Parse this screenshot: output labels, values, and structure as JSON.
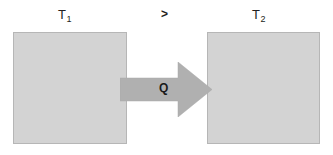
{
  "diagram": {
    "background_color": "#ffffff"
  },
  "labels": {
    "left_temperature": {
      "symbol": "T",
      "subscript": "1"
    },
    "right_temperature": {
      "symbol": "T",
      "subscript": "2"
    },
    "relation": ">",
    "heat_flow": "Q"
  },
  "bodies": [
    {
      "name": "hot-body",
      "temperature_label": "T1",
      "fill_color": "#d3d3d3",
      "border_color": "#b6b6b6"
    },
    {
      "name": "cold-body",
      "temperature_label": "T2",
      "fill_color": "#d3d3d3",
      "border_color": "#b6b6b6"
    }
  ],
  "arrow": {
    "label": "Q",
    "direction": "left-to-right",
    "fill_color": "#b0b0b0"
  }
}
